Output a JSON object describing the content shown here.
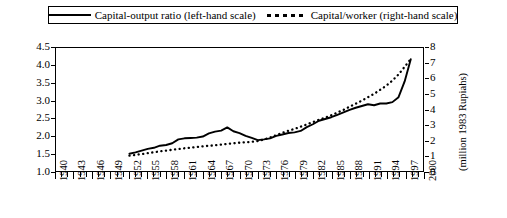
{
  "legend": {
    "entries": [
      {
        "label": "Capital-output ratio (left-hand scale)",
        "style": "solid",
        "swatch_icon": "solid-line-swatch"
      },
      {
        "label": "Capital/worker (right-hand scale)",
        "style": "dotted",
        "swatch_icon": "dotted-line-swatch"
      }
    ]
  },
  "axes": {
    "left_ticks": [
      "1.0",
      "1.5",
      "2.0",
      "2.5",
      "3.0",
      "3.5",
      "4.0",
      "4.5"
    ],
    "right_ticks": [
      "0",
      "1",
      "2",
      "3",
      "4",
      "5",
      "6",
      "7",
      "8"
    ],
    "right_title": "(million 1983 Rupiahs)",
    "x_labels": [
      "1940",
      "1943",
      "1946",
      "1949",
      "1952",
      "1955",
      "1958",
      "1961",
      "1964",
      "1967",
      "1970",
      "1973",
      "1976",
      "1979",
      "1982",
      "1985",
      "1988",
      "1991",
      "1994",
      "1997",
      "2000"
    ]
  },
  "chart_data": {
    "type": "line",
    "title": "",
    "subtitle": "",
    "xlabel": "",
    "ylabel": "",
    "grid": false,
    "legend_position": "top",
    "xlim": [
      1940,
      2000
    ],
    "x_tick_step": 3,
    "x_minor_tick_step": 1,
    "axes": [
      {
        "id": "left",
        "label": "Capital-output ratio",
        "ylim": [
          1.0,
          4.5
        ],
        "tick_step": 0.5
      },
      {
        "id": "right",
        "label": "(million 1983 Rupiahs)",
        "ylim": [
          0,
          8
        ],
        "tick_step": 1
      }
    ],
    "series": [
      {
        "name": "Capital-output ratio (left-hand scale)",
        "axis": "left",
        "style": "solid",
        "color": "#000000",
        "x": [
          1952,
          1953,
          1954,
          1955,
          1956,
          1957,
          1958,
          1959,
          1960,
          1961,
          1962,
          1963,
          1964,
          1965,
          1966,
          1967,
          1968,
          1969,
          1970,
          1971,
          1972,
          1973,
          1974,
          1975,
          1976,
          1977,
          1978,
          1979,
          1980,
          1981,
          1982,
          1983,
          1984,
          1985,
          1986,
          1987,
          1988,
          1989,
          1990,
          1991,
          1992,
          1993,
          1994,
          1995,
          1996,
          1997,
          1998
        ],
        "values": [
          1.49,
          1.53,
          1.58,
          1.63,
          1.66,
          1.72,
          1.74,
          1.79,
          1.9,
          1.93,
          1.94,
          1.95,
          1.98,
          2.07,
          2.12,
          2.15,
          2.24,
          2.13,
          2.08,
          2.0,
          1.94,
          1.88,
          1.9,
          1.93,
          2.0,
          2.04,
          2.08,
          2.1,
          2.14,
          2.25,
          2.33,
          2.43,
          2.48,
          2.53,
          2.6,
          2.67,
          2.74,
          2.8,
          2.85,
          2.9,
          2.87,
          2.92,
          2.92,
          2.96,
          3.1,
          3.55,
          4.18
        ]
      },
      {
        "name": "Capital/worker (right-hand scale)",
        "axis": "right",
        "style": "dotted",
        "color": "#000000",
        "x": [
          1952,
          1953,
          1954,
          1955,
          1956,
          1957,
          1958,
          1959,
          1960,
          1961,
          1962,
          1963,
          1964,
          1965,
          1966,
          1967,
          1968,
          1969,
          1970,
          1971,
          1972,
          1973,
          1974,
          1975,
          1976,
          1977,
          1978,
          1979,
          1980,
          1981,
          1982,
          1983,
          1984,
          1985,
          1986,
          1987,
          1988,
          1989,
          1990,
          1991,
          1992,
          1993,
          1994,
          1995,
          1996,
          1997,
          1998
        ],
        "values": [
          1.0,
          1.05,
          1.1,
          1.16,
          1.22,
          1.28,
          1.33,
          1.38,
          1.43,
          1.48,
          1.52,
          1.56,
          1.6,
          1.64,
          1.68,
          1.72,
          1.76,
          1.8,
          1.84,
          1.87,
          1.9,
          1.95,
          2.05,
          2.18,
          2.33,
          2.48,
          2.62,
          2.74,
          2.88,
          3.03,
          3.18,
          3.33,
          3.47,
          3.62,
          3.8,
          3.98,
          4.18,
          4.38,
          4.58,
          4.8,
          5.02,
          5.28,
          5.55,
          5.88,
          6.28,
          6.78,
          7.28
        ]
      }
    ]
  }
}
